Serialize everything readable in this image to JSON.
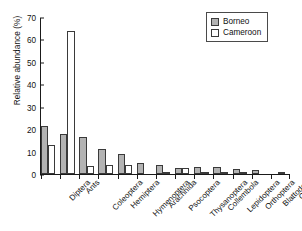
{
  "chart_data": {
    "type": "bar",
    "title": "",
    "xlabel": "",
    "ylabel": "Relative abundance (%)",
    "ylim": [
      0,
      70
    ],
    "yticks": [
      0,
      10,
      20,
      30,
      40,
      50,
      60,
      70
    ],
    "grid": false,
    "legend_position": "top-right",
    "categories": [
      "Diptera",
      "Ants",
      "Coleoptera",
      "Hemiptera",
      "Hymenoptera",
      "Arachnida",
      "Psocoptera",
      "Thysanoptera",
      "Collembola",
      "Lepidoptera",
      "Orthoptera",
      "Blattodea",
      "Others"
    ],
    "series": [
      {
        "name": "Borneo",
        "color": "#b3b3b3",
        "values": [
          21.5,
          18.0,
          16.5,
          11.0,
          9.0,
          5.0,
          3.8,
          2.8,
          3.2,
          3.2,
          2.2,
          1.9,
          0.0
        ]
      },
      {
        "name": "Cameroon",
        "color": "#ffffff",
        "values": [
          12.8,
          63.8,
          3.4,
          4.2,
          4.2,
          0.0,
          0.6,
          2.5,
          0.9,
          1.1,
          0.7,
          0.0,
          0.8
        ]
      }
    ]
  },
  "legend": {
    "items": [
      {
        "label": "Borneo"
      },
      {
        "label": "Cameroon"
      }
    ]
  }
}
